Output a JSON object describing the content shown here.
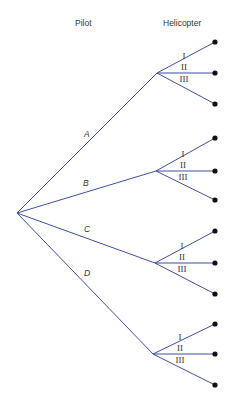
{
  "diagram": {
    "type": "tree",
    "headers": {
      "pilot": "Pilot",
      "helicopter": "Helicopter"
    },
    "colors": {
      "edge": "#3d4f9e",
      "leaf": "#111111",
      "text": "#333333"
    },
    "root": {
      "x": 17,
      "y": 213
    },
    "branches": [
      {
        "label": "A",
        "fork": {
          "x": 157,
          "y": 73
        },
        "label_pos": {
          "x": 84,
          "y": 137
        },
        "leaves": [
          {
            "label": "I",
            "y": 42
          },
          {
            "label": "II",
            "y": 73
          },
          {
            "label": "III",
            "y": 104
          }
        ]
      },
      {
        "label": "B",
        "fork": {
          "x": 156,
          "y": 171
        },
        "label_pos": {
          "x": 83,
          "y": 186
        },
        "leaves": [
          {
            "label": "I",
            "y": 138
          },
          {
            "label": "II",
            "y": 171
          },
          {
            "label": "III",
            "y": 200
          }
        ]
      },
      {
        "label": "C",
        "fork": {
          "x": 155,
          "y": 263
        },
        "label_pos": {
          "x": 84,
          "y": 232
        },
        "leaves": [
          {
            "label": "I",
            "y": 231
          },
          {
            "label": "II",
            "y": 263
          },
          {
            "label": "III",
            "y": 294
          }
        ]
      },
      {
        "label": "D",
        "fork": {
          "x": 153,
          "y": 354
        },
        "label_pos": {
          "x": 84,
          "y": 276
        },
        "leaves": [
          {
            "label": "I",
            "y": 324
          },
          {
            "label": "II",
            "y": 354
          },
          {
            "label": "III",
            "y": 385
          }
        ]
      }
    ],
    "leaf_x": 215
  }
}
